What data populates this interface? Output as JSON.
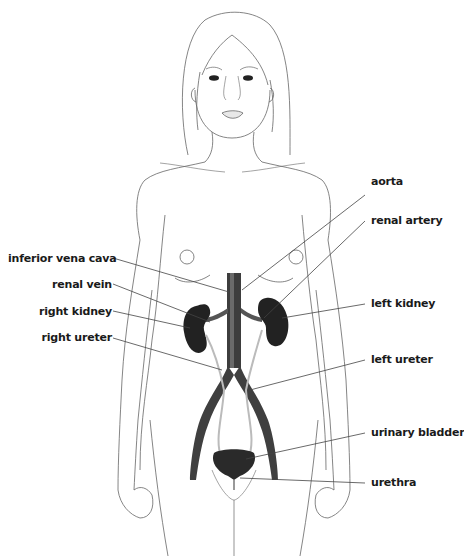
{
  "diagram": {
    "colors": {
      "outline": "#555555",
      "organ_dark": "#2b2b2b",
      "vessel": "#4a4a4a",
      "leader_line": "#444444",
      "label_text": "#1a1a1a"
    },
    "labels": {
      "left": [
        {
          "id": "inferior-vena-cava",
          "text": "inferior vena cava"
        },
        {
          "id": "renal-vein",
          "text": "renal vein"
        },
        {
          "id": "right-kidney",
          "text": "right kidney"
        },
        {
          "id": "right-ureter",
          "text": "right ureter"
        }
      ],
      "right": [
        {
          "id": "aorta",
          "text": "aorta"
        },
        {
          "id": "renal-artery",
          "text": "renal artery"
        },
        {
          "id": "left-kidney",
          "text": "left kidney"
        },
        {
          "id": "left-ureter",
          "text": "left ureter"
        },
        {
          "id": "urinary-bladder",
          "text": "urinary bladder"
        },
        {
          "id": "urethra",
          "text": "urethra"
        }
      ]
    }
  }
}
